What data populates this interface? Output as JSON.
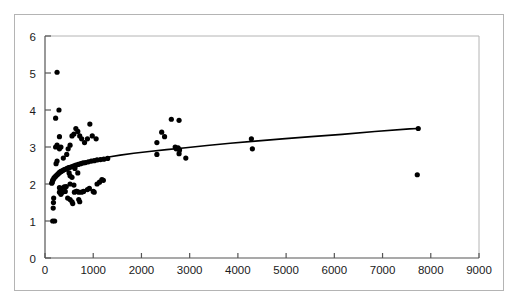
{
  "figure": {
    "title": "",
    "background_color": "#ffffff",
    "frame_color": "#b4b4b4",
    "axis_color": "#555555",
    "marker_color": "#000000",
    "curve_color": "#000000"
  },
  "chart_data": {
    "type": "scatter",
    "title": "",
    "xlabel": "",
    "ylabel": "",
    "xlim": [
      0,
      9000
    ],
    "ylim": [
      0,
      6
    ],
    "xticks": [
      0,
      1000,
      2000,
      3000,
      4000,
      5000,
      6000,
      7000,
      8000,
      9000
    ],
    "yticks": [
      0,
      1,
      2,
      3,
      4,
      5,
      6
    ],
    "xtick_labels": [
      "0",
      "1000",
      "2000",
      "3000",
      "4000",
      "5000",
      "6000",
      "7000",
      "8000",
      "9000"
    ],
    "ytick_labels": [
      "0",
      "1",
      "2",
      "3",
      "4",
      "5",
      "6"
    ],
    "grid": false,
    "legend": null,
    "marker_size": 2.6,
    "series": [
      {
        "name": "observations",
        "type": "scatter",
        "color": "#000000",
        "points": [
          [
            160,
            1.0
          ],
          [
            200,
            1.0
          ],
          [
            170,
            1.35
          ],
          [
            175,
            1.5
          ],
          [
            180,
            1.62
          ],
          [
            300,
            1.78
          ],
          [
            330,
            1.72
          ],
          [
            360,
            1.78
          ],
          [
            420,
            1.8
          ],
          [
            470,
            1.62
          ],
          [
            520,
            1.58
          ],
          [
            560,
            1.52
          ],
          [
            575,
            1.47
          ],
          [
            610,
            1.78
          ],
          [
            650,
            1.8
          ],
          [
            700,
            1.58
          ],
          [
            720,
            1.52
          ],
          [
            760,
            1.78
          ],
          [
            800,
            1.8
          ],
          [
            300,
            1.9
          ],
          [
            340,
            1.88
          ],
          [
            400,
            1.92
          ],
          [
            440,
            1.93
          ],
          [
            520,
            2.0
          ],
          [
            600,
            1.97
          ],
          [
            660,
            1.8
          ],
          [
            700,
            1.78
          ],
          [
            880,
            1.85
          ],
          [
            920,
            1.88
          ],
          [
            1000,
            1.8
          ],
          [
            1020,
            1.78
          ],
          [
            1080,
            2.0
          ],
          [
            1130,
            2.05
          ],
          [
            1180,
            2.12
          ],
          [
            1210,
            2.1
          ],
          [
            140,
            2.02
          ],
          [
            150,
            2.05
          ],
          [
            160,
            2.1
          ],
          [
            170,
            2.12
          ],
          [
            185,
            2.16
          ],
          [
            200,
            2.18
          ],
          [
            215,
            2.2
          ],
          [
            230,
            2.22
          ],
          [
            250,
            2.25
          ],
          [
            270,
            2.27
          ],
          [
            290,
            2.3
          ],
          [
            310,
            2.32
          ],
          [
            330,
            2.34
          ],
          [
            350,
            2.35
          ],
          [
            375,
            2.37
          ],
          [
            400,
            2.39
          ],
          [
            430,
            2.4
          ],
          [
            460,
            2.42
          ],
          [
            490,
            2.44
          ],
          [
            520,
            2.45
          ],
          [
            560,
            2.47
          ],
          [
            600,
            2.49
          ],
          [
            640,
            2.51
          ],
          [
            690,
            2.53
          ],
          [
            740,
            2.55
          ],
          [
            790,
            2.57
          ],
          [
            840,
            2.58
          ],
          [
            900,
            2.6
          ],
          [
            960,
            2.62
          ],
          [
            1020,
            2.63
          ],
          [
            1080,
            2.65
          ],
          [
            1150,
            2.66
          ],
          [
            1220,
            2.67
          ],
          [
            1300,
            2.69
          ],
          [
            500,
            2.3
          ],
          [
            520,
            2.22
          ],
          [
            560,
            2.18
          ],
          [
            620,
            2.42
          ],
          [
            680,
            2.3
          ],
          [
            230,
            2.55
          ],
          [
            250,
            2.62
          ],
          [
            300,
            2.95
          ],
          [
            380,
            2.7
          ],
          [
            450,
            2.8
          ],
          [
            220,
            3.0
          ],
          [
            250,
            3.05
          ],
          [
            300,
            3.28
          ],
          [
            330,
            3.0
          ],
          [
            480,
            2.95
          ],
          [
            520,
            3.05
          ],
          [
            560,
            3.3
          ],
          [
            600,
            3.35
          ],
          [
            640,
            3.5
          ],
          [
            680,
            3.42
          ],
          [
            720,
            3.3
          ],
          [
            760,
            3.22
          ],
          [
            820,
            3.12
          ],
          [
            880,
            3.22
          ],
          [
            930,
            3.62
          ],
          [
            980,
            3.3
          ],
          [
            1060,
            3.22
          ],
          [
            220,
            3.78
          ],
          [
            290,
            4.0
          ],
          [
            250,
            5.02
          ],
          [
            2320,
            3.12
          ],
          [
            2420,
            3.4
          ],
          [
            2480,
            3.28
          ],
          [
            2620,
            3.75
          ],
          [
            2780,
            3.72
          ],
          [
            2720,
            2.95
          ],
          [
            2760,
            2.98
          ],
          [
            2790,
            2.92
          ],
          [
            2780,
            2.82
          ],
          [
            2700,
            3.0
          ],
          [
            2920,
            2.7
          ],
          [
            2320,
            2.8
          ],
          [
            4280,
            3.22
          ],
          [
            4300,
            2.95
          ],
          [
            7740,
            3.5
          ],
          [
            7720,
            2.25
          ]
        ]
      },
      {
        "name": "fitted-curve",
        "type": "line",
        "color": "#000000",
        "line_width": 1.6,
        "points": [
          [
            150,
            2.02
          ],
          [
            200,
            2.14
          ],
          [
            260,
            2.24
          ],
          [
            330,
            2.32
          ],
          [
            420,
            2.4
          ],
          [
            520,
            2.46
          ],
          [
            640,
            2.52
          ],
          [
            780,
            2.58
          ],
          [
            940,
            2.63
          ],
          [
            1120,
            2.68
          ],
          [
            1320,
            2.73
          ],
          [
            1560,
            2.78
          ],
          [
            1840,
            2.83
          ],
          [
            2160,
            2.88
          ],
          [
            2520,
            2.93
          ],
          [
            2920,
            2.98
          ],
          [
            3360,
            3.04
          ],
          [
            3840,
            3.1
          ],
          [
            4360,
            3.16
          ],
          [
            4920,
            3.22
          ],
          [
            5520,
            3.28
          ],
          [
            6160,
            3.34
          ],
          [
            6840,
            3.42
          ],
          [
            7560,
            3.49
          ],
          [
            7740,
            3.5
          ]
        ]
      }
    ]
  },
  "axes": {
    "x_axis_name": "x-axis",
    "y_axis_name": "y-axis"
  }
}
